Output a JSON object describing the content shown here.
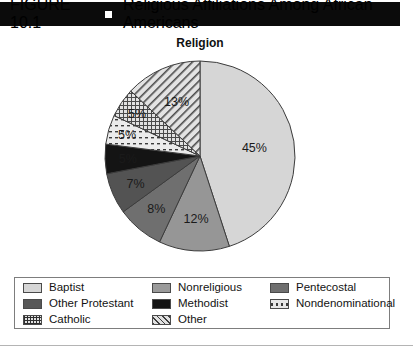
{
  "figure": {
    "number": "FIGURE 10.1",
    "bullet_icon": "square-bullet-icon",
    "title": "Religious Affiliations Among African Americans"
  },
  "chart_title": "Religion",
  "legend": {
    "items": [
      {
        "label": "Baptist",
        "swatch": "sw-baptist",
        "swatch_name": "legend-swatch-baptist"
      },
      {
        "label": "Nonreligious",
        "swatch": "sw-nonreligious",
        "swatch_name": "legend-swatch-nonreligious"
      },
      {
        "label": "Pentecostal",
        "swatch": "sw-pentecostal",
        "swatch_name": "legend-swatch-pentecostal"
      },
      {
        "label": "Other Protestant",
        "swatch": "sw-otherprotestant",
        "swatch_name": "legend-swatch-other-protestant"
      },
      {
        "label": "Methodist",
        "swatch": "sw-methodist",
        "swatch_name": "legend-swatch-methodist"
      },
      {
        "label": "Nondenominational",
        "swatch": "sw-nondenom",
        "swatch_name": "legend-swatch-nondenominational"
      },
      {
        "label": "Catholic",
        "swatch": "sw-catholic",
        "swatch_name": "legend-swatch-catholic"
      },
      {
        "label": "Other",
        "swatch": "sw-other",
        "swatch_name": "legend-swatch-other"
      }
    ]
  },
  "chart_data": {
    "type": "pie",
    "title": "Religion",
    "xlabel": "",
    "ylabel": "",
    "units": "percent",
    "start_angle_deg": 0,
    "direction": "clockwise",
    "legend_position": "bottom",
    "grid": false,
    "categories": [
      "Baptist",
      "Nonreligious",
      "Other Protestant",
      "Pentecostal",
      "Methodist",
      "Nondenominational",
      "Catholic",
      "Other"
    ],
    "values": [
      45,
      12,
      8,
      7,
      5,
      5,
      5,
      13
    ],
    "labels": [
      "45%",
      "12%",
      "8%",
      "7%",
      "5%",
      "5%",
      "5%",
      "13%"
    ],
    "colors": [
      "#d6d6d6",
      "#969696",
      "#6f6f6f",
      "#535353",
      "#141414",
      "#ebebeb",
      "#d2d2d2",
      "#dcdcdc"
    ],
    "fill_styles": [
      "solid",
      "solid",
      "solid",
      "solid",
      "solid",
      "dashes",
      "crosshatch",
      "diagonal-stripes"
    ],
    "label_colors": [
      "#1a1a1a",
      "#1a1a1a",
      "#ffffff",
      "#ffffff",
      "#ffffff",
      "#1a1a1a",
      "#1a1a1a",
      "#1a1a1a"
    ]
  }
}
